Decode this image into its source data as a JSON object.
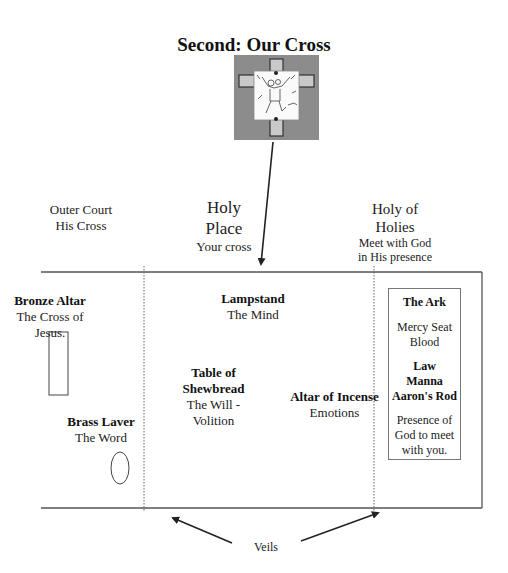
{
  "title": "Second:  Our Cross",
  "image": {
    "icon": "cross-with-figure-illustration"
  },
  "sections": [
    {
      "id": "outer-court",
      "name": "Outer Court",
      "subtitle": "His Cross"
    },
    {
      "id": "holy-place",
      "name_line1": "Holy",
      "name_line2": "Place",
      "subtitle": "Your cross"
    },
    {
      "id": "holy-of-holies",
      "name_line1": "Holy of",
      "name_line2": "Holies",
      "subtitle_line1": "Meet with God",
      "subtitle_line2": "in His presence"
    }
  ],
  "items": {
    "bronze_altar": {
      "name": "Bronze Altar",
      "meaning": "The Cross of Jesus."
    },
    "brass_laver": {
      "name": "Brass Laver",
      "meaning": "The Word"
    },
    "lampstand": {
      "name": "Lampstand",
      "meaning": "The Mind"
    },
    "table_of_shewbread": {
      "name_line1": "Table of",
      "name_line2": "Shewbread",
      "meaning": "The Will - Volition"
    },
    "altar_of_incense": {
      "name": "Altar of Incense",
      "meaning": "Emotions"
    }
  },
  "ark": {
    "title": "The Ark",
    "mercy_line1": "Mercy Seat",
    "mercy_line2": "Blood",
    "contents": [
      "Law",
      "Manna",
      "Aaron's Rod"
    ],
    "presence_line1": "Presence of",
    "presence_line2": "God to meet",
    "presence_line3": "with you."
  },
  "veils_label": "Veils"
}
